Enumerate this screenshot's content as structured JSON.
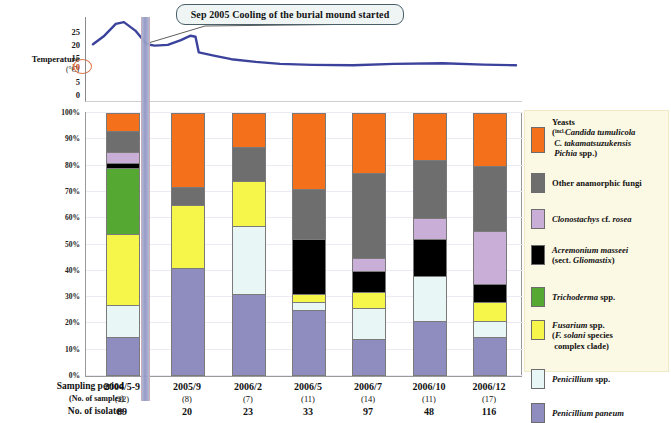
{
  "temperature": {
    "axis_label": "Temperature",
    "axis_unit": "(°C)",
    "ticks": [
      "25",
      "20",
      "15",
      "10",
      "5",
      "0"
    ],
    "highlighted_tick": "10"
  },
  "callout": {
    "text": "Sep 2005  Cooling of the burial mound started"
  },
  "yaxis": {
    "ticks": [
      "100%",
      "90%",
      "80%",
      "70%",
      "60%",
      "50%",
      "40%",
      "30%",
      "20%",
      "10%",
      "0%"
    ]
  },
  "table": {
    "row1_label": "Sampling period",
    "row2_label": "(No. of samples)",
    "row3_label": "No. of isolates"
  },
  "legend": {
    "items": [
      {
        "name": "yeasts",
        "color": "#F4701A",
        "line1_pre": "Yeasts",
        "line2_tiny": "incl.",
        "line2_it": "Candida tumulicola",
        "line3_it": "C. takamatsuzukensis",
        "line4_it": "Pichia",
        "line4_post": "spp.)"
      },
      {
        "name": "other-anamorphic-fungi",
        "color": "#6E6E6E",
        "label": "Other anamorphic fungi"
      },
      {
        "name": "clonostachys-cf-rosea",
        "color": "#C9AFD8",
        "it1": "Clonostachys",
        "post1": "cf.",
        "it2": "rosea"
      },
      {
        "name": "acremonium-masseei",
        "color": "#000000",
        "it1": "Acremonium masseei",
        "line2_pre": "(sect.",
        "line2_it": "Gliomastix",
        "line2_post": ")"
      },
      {
        "name": "trichoderma-spp",
        "color": "#55A832",
        "it1": "Trichoderma",
        "post1": "spp."
      },
      {
        "name": "fusarium-spp",
        "color": "#F6F64A",
        "it1": "Fusarium",
        "post1": "spp.",
        "line2_pre": "(",
        "line2_it": "F. solani",
        "line2_post": "species",
        "line3": "complex clade)"
      },
      {
        "name": "penicillium-spp",
        "color": "#E8F6F6",
        "it1": "Penicillium",
        "post1": "spp."
      },
      {
        "name": "penicillium-paneum",
        "color": "#8F8CC0",
        "it1": "Penicillium paneum"
      }
    ]
  },
  "chart_data": {
    "type": "bar",
    "title": "",
    "xlabel": "Sampling period",
    "ylabel": "",
    "ylim": [
      0,
      100
    ],
    "grid": true,
    "stacked": true,
    "legend_position": "right",
    "categories": [
      "2004/5-9",
      "2005/9",
      "2006/2",
      "2006/5",
      "2006/7",
      "2006/10",
      "2006/12"
    ],
    "no_of_samples": [
      "(22)",
      "(8)",
      "(7)",
      "(11)",
      "(14)",
      "(11)",
      "(17)"
    ],
    "no_of_isolates": [
      89,
      20,
      23,
      33,
      97,
      48,
      116
    ],
    "series": [
      {
        "name": "Penicillium paneum",
        "color": "#8F8CC0",
        "values": [
          15,
          41,
          31,
          25,
          14,
          21,
          15
        ]
      },
      {
        "name": "Penicillium spp.",
        "color": "#E8F6F6",
        "values": [
          12,
          0,
          26,
          3,
          12,
          17,
          6
        ]
      },
      {
        "name": "Fusarium spp. (F. solani species complex clade)",
        "color": "#F6F64A",
        "values": [
          27,
          24,
          17,
          3,
          6,
          0,
          7
        ]
      },
      {
        "name": "Trichoderma spp.",
        "color": "#55A832",
        "values": [
          25,
          0,
          0,
          0,
          0,
          0,
          0
        ]
      },
      {
        "name": "Acremonium masseei (sect. Gliomastix)",
        "color": "#000000",
        "values": [
          2,
          0,
          0,
          21,
          8,
          14,
          7
        ]
      },
      {
        "name": "Clonostachys cf. rosea",
        "color": "#C9AFD8",
        "values": [
          4,
          0,
          0,
          0,
          5,
          8,
          20
        ]
      },
      {
        "name": "Other anamorphic fungi",
        "color": "#6E6E6E",
        "values": [
          8,
          7,
          13,
          19,
          32,
          22,
          25
        ]
      },
      {
        "name": "Yeasts (incl. Candida tumulicola, C. takamatsuzukensis, Pichia spp.)",
        "color": "#F4701A",
        "values": [
          7,
          28,
          13,
          29,
          23,
          18,
          20
        ]
      }
    ],
    "temperature_curve": {
      "ylabel": "Temperature (°C)",
      "ylim": [
        0,
        25
      ],
      "yticks": [
        0,
        5,
        10,
        15,
        20,
        25
      ],
      "points": [
        {
          "x": 0,
          "y": 17.0
        },
        {
          "x": 7,
          "y": 19.5
        },
        {
          "x": 14,
          "y": 23.0
        },
        {
          "x": 19,
          "y": 23.5
        },
        {
          "x": 26,
          "y": 21.0
        },
        {
          "x": 33,
          "y": 17.0
        },
        {
          "x": 38,
          "y": 16.6
        },
        {
          "x": 46,
          "y": 16.8
        },
        {
          "x": 54,
          "y": 18.2
        },
        {
          "x": 60,
          "y": 19.5
        },
        {
          "x": 63,
          "y": 19.2
        },
        {
          "x": 65,
          "y": 14.6
        },
        {
          "x": 75,
          "y": 13.6
        },
        {
          "x": 85,
          "y": 12.6
        },
        {
          "x": 100,
          "y": 11.8
        },
        {
          "x": 115,
          "y": 11.2
        },
        {
          "x": 135,
          "y": 10.9
        },
        {
          "x": 160,
          "y": 10.8
        },
        {
          "x": 185,
          "y": 11.2
        },
        {
          "x": 215,
          "y": 11.4
        },
        {
          "x": 240,
          "y": 11.0
        },
        {
          "x": 260,
          "y": 10.8
        }
      ],
      "marker_line_label": "Sep 2005"
    }
  }
}
